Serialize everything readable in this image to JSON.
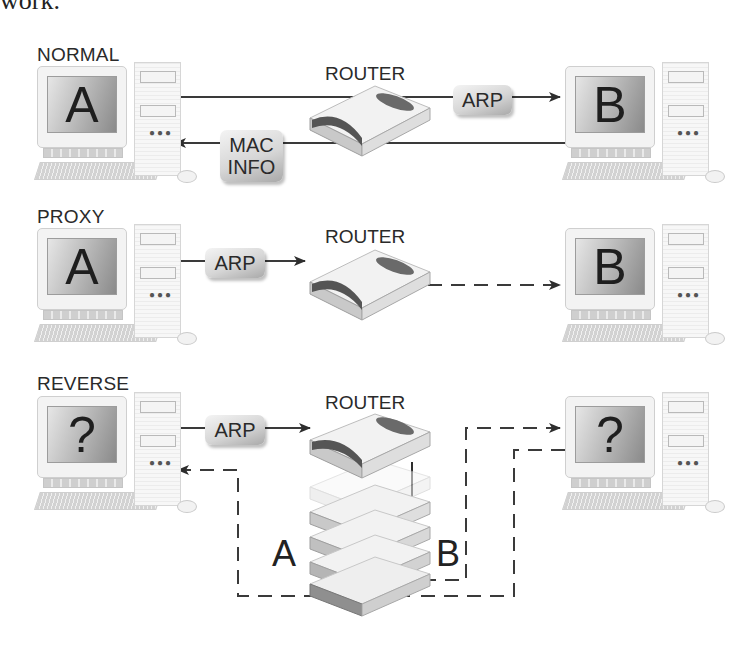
{
  "header_fragment": "work.",
  "colors": {
    "line": "#3a3a3a",
    "pill_light": "#f4f4f4",
    "pill_dark": "#a9a9a9",
    "screen_light": "#e6e6e6",
    "screen_dark": "#8a8a8a"
  },
  "sections": {
    "normal": {
      "label": "NORMAL",
      "router_label": "ROUTER",
      "left_computer": "A",
      "right_computer": "B",
      "request_pill": "ARP",
      "response_pill_line1": "MAC",
      "response_pill_line2": "INFO"
    },
    "proxy": {
      "label": "PROXY",
      "router_label": "ROUTER",
      "left_computer": "A",
      "right_computer": "B",
      "request_pill": "ARP"
    },
    "reverse": {
      "label": "REVERSE",
      "router_label": "ROUTER",
      "left_computer": "?",
      "right_computer": "?",
      "request_pill": "ARP",
      "path_label_a": "A",
      "path_label_b": "B"
    }
  }
}
